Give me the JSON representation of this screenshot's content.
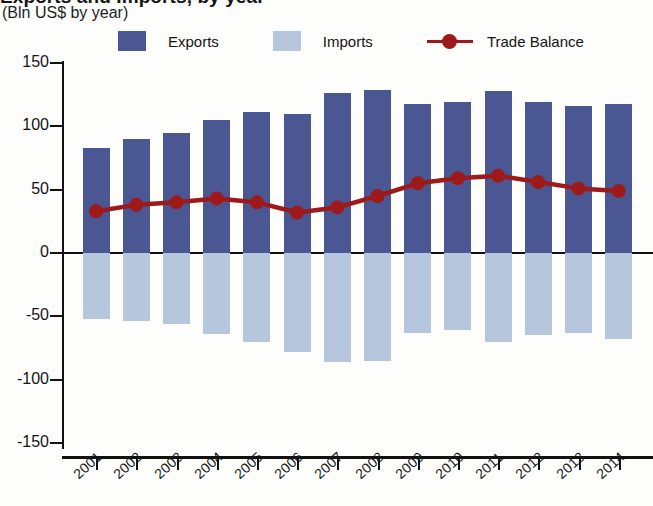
{
  "header": {
    "title_fragment": "Exports and Imports, by year",
    "subtitle": "(Bln US$ by year)"
  },
  "legend": {
    "items": [
      {
        "label": "Exports",
        "color": "#4a5792",
        "marker": "square"
      },
      {
        "label": "Imports",
        "color": "#b6c6dc",
        "marker": "square"
      },
      {
        "label": "Trade Balance",
        "color": "#9e1a1a",
        "marker": "line-dot"
      }
    ]
  },
  "axes": {
    "y_ticks": [
      "150",
      "100",
      "50",
      "0",
      "-50",
      "-100",
      "-150"
    ],
    "x_ticks": [
      "2001",
      "2002",
      "2003",
      "2004",
      "2005",
      "2006",
      "2007",
      "2008",
      "2009",
      "2010",
      "2011",
      "2012",
      "2013",
      "2014"
    ]
  },
  "chart_data": {
    "type": "bar",
    "title": "Exports and Imports, by year",
    "subtitle": "(Bln US$ by year)",
    "xlabel": "",
    "ylabel": "Bln US$",
    "ylim": [
      -150,
      150
    ],
    "ytick_values": [
      150,
      100,
      50,
      0,
      -50,
      -100,
      -150
    ],
    "grid": false,
    "legend_position": "top",
    "categories": [
      "2001",
      "2002",
      "2003",
      "2004",
      "2005",
      "2006",
      "2007",
      "2008",
      "2009",
      "2010",
      "2011",
      "2012",
      "2013",
      "2014"
    ],
    "series": [
      {
        "name": "Exports",
        "type": "bar",
        "color": "#4a5792",
        "values": [
          83,
          90,
          95,
          105,
          111,
          110,
          126,
          129,
          118,
          119,
          128,
          119,
          116,
          118
        ]
      },
      {
        "name": "Imports",
        "type": "bar",
        "color": "#b6c6dc",
        "values": [
          -52,
          -54,
          -56,
          -64,
          -70,
          -78,
          -86,
          -85,
          -63,
          -61,
          -70,
          -65,
          -63,
          -68
        ]
      },
      {
        "name": "Trade Balance",
        "type": "line",
        "color": "#9e1a1a",
        "values": [
          33,
          38,
          40,
          43,
          40,
          32,
          36,
          45,
          55,
          59,
          61,
          56,
          51,
          49
        ]
      }
    ]
  }
}
